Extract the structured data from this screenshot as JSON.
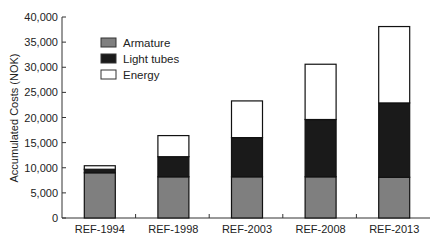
{
  "chart_data": {
    "type": "bar",
    "stacked": true,
    "title": "",
    "xlabel": "",
    "ylabel": "Accumulated Costs (NOK)",
    "ylim": [
      0,
      40000
    ],
    "yticks": [
      0,
      5000,
      10000,
      15000,
      20000,
      25000,
      30000,
      35000,
      40000
    ],
    "ytick_labels": [
      "0",
      "5,000",
      "10,000",
      "15,000",
      "20,000",
      "25,000",
      "30,000",
      "35,000",
      "40,000"
    ],
    "categories": [
      "REF-1994",
      "REF-1998",
      "REF-2003",
      "REF-2008",
      "REF-2013"
    ],
    "series": [
      {
        "name": "Armature",
        "color": "#7f7f7f",
        "values": [
          9000,
          8200,
          8200,
          8200,
          8100
        ]
      },
      {
        "name": "Light tubes",
        "color": "#1a1a1a",
        "values": [
          700,
          4000,
          7800,
          11400,
          14800
        ]
      },
      {
        "name": "Energy",
        "color": "#ffffff",
        "values": [
          700,
          4200,
          7300,
          11000,
          15200
        ]
      }
    ],
    "totals": [
      10400,
      16400,
      23300,
      30600,
      38100
    ],
    "grid": false,
    "legend_position": "upper left"
  }
}
